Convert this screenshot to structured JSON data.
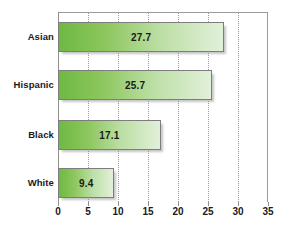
{
  "chart_data": {
    "type": "bar",
    "orientation": "horizontal",
    "title": "",
    "xlabel": "",
    "ylabel": "",
    "categories": [
      "Asian",
      "Hispanic",
      "Black",
      "White"
    ],
    "values": [
      27.7,
      25.7,
      17.1,
      9.4
    ],
    "value_labels": [
      "27.7",
      "25.7",
      "17.1",
      "9.4"
    ],
    "xlim": [
      0,
      35
    ],
    "xticks": [
      0,
      5,
      10,
      15,
      20,
      25,
      30,
      35
    ],
    "xtick_labels": [
      "0",
      "5",
      "10",
      "15",
      "20",
      "25",
      "30",
      "35"
    ],
    "grid": "vertical-dotted",
    "legend": "none",
    "colors": {
      "bar_gradient_start": "#6eb944",
      "bar_gradient_end": "#e2f0da",
      "bar_border": "#7d7d7d",
      "gridline": "#9a9a9a",
      "axis": "#8f8f8f",
      "text": "#1a1a1a",
      "background": "#ffffff"
    }
  }
}
